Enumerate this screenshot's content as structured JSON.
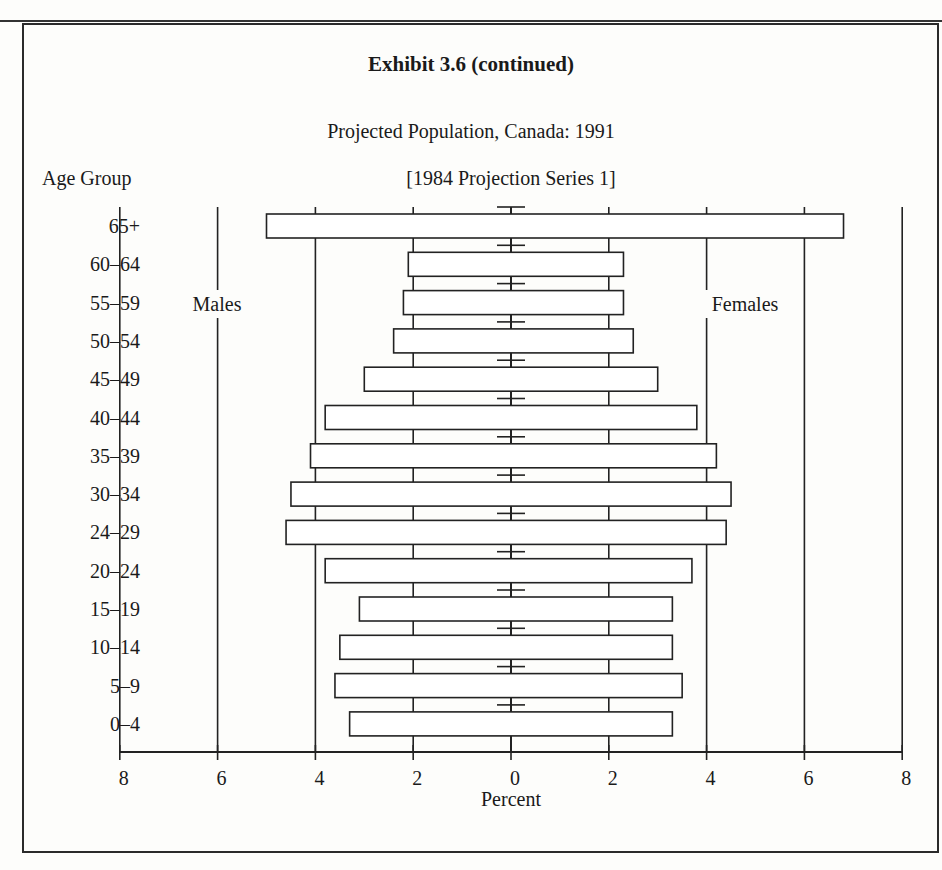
{
  "page": {
    "header_fragment": "g g",
    "exhibit_title": "Exhibit 3.6 (continued)",
    "subtitle": "Projected Population, Canada: 1991",
    "series_label": "[1984 Projection Series 1]",
    "y_axis_label": "Age Group",
    "x_axis_label": "Percent",
    "males_label": "Males",
    "females_label": "Females"
  },
  "chart_data": {
    "type": "bar",
    "orientation": "horizontal-population-pyramid",
    "title": "Exhibit 3.6 (continued)",
    "subtitle": "Projected Population, Canada: 1991 [1984 Projection Series 1]",
    "xlabel": "Percent",
    "ylabel": "Age Group",
    "categories": [
      "65+",
      "60–64",
      "55–59",
      "50–54",
      "45–49",
      "40–44",
      "35–39",
      "30–34",
      "24–29",
      "20–24",
      "15–19",
      "10–14",
      "5–9",
      "0–4"
    ],
    "series": [
      {
        "name": "Males",
        "side": "left",
        "values": [
          5.0,
          2.1,
          2.2,
          2.4,
          3.0,
          3.8,
          4.1,
          4.5,
          4.6,
          3.8,
          3.1,
          3.5,
          3.6,
          3.3
        ]
      },
      {
        "name": "Females",
        "side": "right",
        "values": [
          6.8,
          2.3,
          2.3,
          2.5,
          3.0,
          3.8,
          4.2,
          4.5,
          4.4,
          3.7,
          3.3,
          3.3,
          3.5,
          3.3
        ]
      }
    ],
    "x_ticks": [
      "8",
      "6",
      "4",
      "2",
      "0",
      "2",
      "4",
      "6",
      "8"
    ],
    "xlim": [
      -8,
      8
    ],
    "grid": true,
    "colors": {
      "bar_fill": "#ffffff",
      "bar_stroke": "#222222",
      "grid": "#222222"
    }
  }
}
